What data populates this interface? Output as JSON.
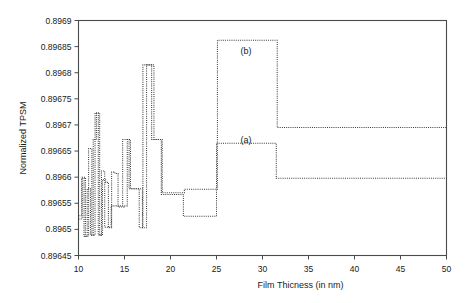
{
  "chart_data": {
    "type": "line",
    "title": "",
    "xlabel": "Film Thicness (in nm)",
    "ylabel": "Normalized TPSM",
    "xlim": [
      10,
      50
    ],
    "ylim": [
      0.89645,
      0.8969
    ],
    "xticks": [
      10,
      15,
      20,
      25,
      30,
      35,
      40,
      45,
      50
    ],
    "xtick_labels": [
      "10",
      "15",
      "20",
      "25",
      "30",
      "35",
      "40",
      "45",
      "50"
    ],
    "yticks": [
      0.89645,
      0.8965,
      0.89655,
      0.8966,
      0.89665,
      0.8967,
      0.89675,
      0.8968,
      0.89685,
      0.8969
    ],
    "ytick_labels": [
      "0.89645",
      "0.8965",
      "0.89655",
      "0.8966",
      "0.89665",
      "0.8967",
      "0.89675",
      "0.8968",
      "0.89685",
      "0.8969"
    ],
    "grid": false,
    "legend": "inline-annotations",
    "linestyle": "dotted",
    "color": "#3a3a3a",
    "annotations": [
      {
        "text": "(a)",
        "x": 28.2,
        "y": 0.896665
      },
      {
        "text": "(b)",
        "x": 28.2,
        "y": 0.896835
      }
    ],
    "series": [
      {
        "name": "(a)",
        "step_style": "post",
        "points": [
          [
            10.0,
            0.896526
          ],
          [
            10.35,
            0.896526
          ],
          [
            10.35,
            0.896598
          ],
          [
            10.6,
            0.896598
          ],
          [
            10.6,
            0.896487
          ],
          [
            10.95,
            0.896487
          ],
          [
            10.95,
            0.896578
          ],
          [
            11.3,
            0.896578
          ],
          [
            11.3,
            0.896489
          ],
          [
            11.6,
            0.896489
          ],
          [
            11.6,
            0.896672
          ],
          [
            11.95,
            0.896672
          ],
          [
            11.95,
            0.896723
          ],
          [
            12.3,
            0.896723
          ],
          [
            12.3,
            0.896489
          ],
          [
            12.6,
            0.896489
          ],
          [
            12.6,
            0.896595
          ],
          [
            12.95,
            0.896595
          ],
          [
            12.95,
            0.89659
          ],
          [
            13.25,
            0.89659
          ],
          [
            13.25,
            0.896503
          ],
          [
            13.6,
            0.896503
          ],
          [
            13.6,
            0.89661
          ],
          [
            13.95,
            0.89661
          ],
          [
            13.95,
            0.896607
          ],
          [
            14.3,
            0.896607
          ],
          [
            14.3,
            0.896543
          ],
          [
            14.95,
            0.896543
          ],
          [
            14.95,
            0.896545
          ],
          [
            15.3,
            0.896545
          ],
          [
            15.3,
            0.896672
          ],
          [
            15.65,
            0.896672
          ],
          [
            15.65,
            0.896578
          ],
          [
            16.6,
            0.896578
          ],
          [
            16.6,
            0.896503
          ],
          [
            17.0,
            0.896503
          ],
          [
            17.0,
            0.896815
          ],
          [
            17.95,
            0.896815
          ],
          [
            17.95,
            0.896672
          ],
          [
            19.0,
            0.896672
          ],
          [
            19.0,
            0.896567
          ],
          [
            21.4,
            0.896567
          ],
          [
            21.4,
            0.896525
          ],
          [
            25.0,
            0.896525
          ],
          [
            25.0,
            0.896665
          ],
          [
            31.5,
            0.896665
          ],
          [
            31.5,
            0.896598
          ],
          [
            50.0,
            0.896598
          ]
        ]
      },
      {
        "name": "(b)",
        "step_style": "post",
        "points": [
          [
            10.0,
            0.89652
          ],
          [
            10.4,
            0.89652
          ],
          [
            10.4,
            0.8966
          ],
          [
            10.75,
            0.8966
          ],
          [
            10.75,
            0.896487
          ],
          [
            11.1,
            0.896487
          ],
          [
            11.1,
            0.896655
          ],
          [
            11.45,
            0.896655
          ],
          [
            11.45,
            0.896489
          ],
          [
            11.8,
            0.896489
          ],
          [
            11.8,
            0.896723
          ],
          [
            12.15,
            0.896723
          ],
          [
            12.15,
            0.896489
          ],
          [
            12.5,
            0.896489
          ],
          [
            12.5,
            0.896612
          ],
          [
            12.85,
            0.896612
          ],
          [
            12.85,
            0.896504
          ],
          [
            13.55,
            0.896504
          ],
          [
            13.55,
            0.896545
          ],
          [
            14.8,
            0.896545
          ],
          [
            14.8,
            0.896672
          ],
          [
            15.5,
            0.896672
          ],
          [
            15.5,
            0.896578
          ],
          [
            16.95,
            0.896578
          ],
          [
            16.95,
            0.896503
          ],
          [
            17.4,
            0.896503
          ],
          [
            17.4,
            0.896815
          ],
          [
            18.2,
            0.896815
          ],
          [
            18.2,
            0.896672
          ],
          [
            19.1,
            0.896672
          ],
          [
            19.1,
            0.89657
          ],
          [
            21.5,
            0.89657
          ],
          [
            21.5,
            0.896577
          ],
          [
            25.1,
            0.896577
          ],
          [
            25.1,
            0.896862
          ],
          [
            31.6,
            0.896862
          ],
          [
            31.6,
            0.896695
          ],
          [
            50.0,
            0.896695
          ]
        ]
      }
    ]
  },
  "axis": {
    "x_title": "Film Thicness (in nm)",
    "y_title": "Normalized TPSM"
  }
}
